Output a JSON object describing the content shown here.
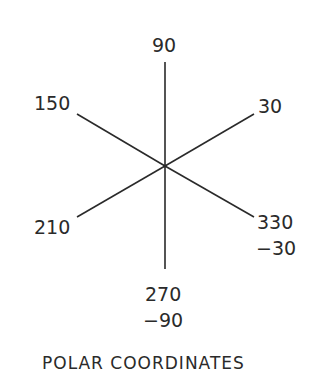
{
  "diagram": {
    "title": "POLAR COORDINATES",
    "center": [
      165,
      166
    ],
    "rays": [
      {
        "angle": 90,
        "end": [
          165,
          62
        ]
      },
      {
        "angle": 270,
        "end": [
          165,
          269
        ]
      },
      {
        "angle": 30,
        "end": [
          254,
          114
        ]
      },
      {
        "angle": 150,
        "end": [
          77,
          114
        ]
      },
      {
        "angle": 210,
        "end": [
          77,
          217
        ]
      },
      {
        "angle": 330,
        "end": [
          254,
          217
        ]
      }
    ],
    "labels": {
      "deg_90": "90",
      "deg_30": "30",
      "deg_150": "150",
      "deg_210": "210",
      "deg_330": "330",
      "deg_neg30": "−30",
      "deg_270": "270",
      "deg_neg90": "−90"
    },
    "line_color": "#2a2a2a"
  }
}
